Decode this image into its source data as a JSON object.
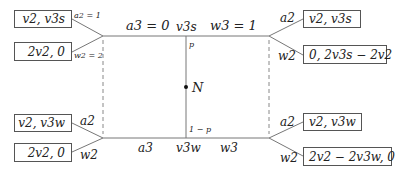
{
  "diagram": {
    "type": "game-tree",
    "nature_node": "N",
    "probabilities": {
      "top": "p",
      "bottom": "1 − p"
    },
    "top_branch": {
      "node_label": "v3s",
      "left_action": "a3 = 0",
      "right_action": "w3 = 1",
      "left_subtree": {
        "action_a_label": "a2 = 1",
        "action_w_label": "w2 = 2",
        "payoff_a": "v2, v3s",
        "payoff_w": "2v2, 0"
      },
      "right_subtree": {
        "action_a_label": "a2",
        "action_w_label": "w2",
        "payoff_a": "v2, v3s",
        "payoff_w": "0, 2v3s − 2v2"
      }
    },
    "bottom_branch": {
      "node_label": "v3w",
      "left_action": "a3",
      "right_action": "w3",
      "left_subtree": {
        "action_a_label": "a2",
        "action_w_label": "w2",
        "payoff_a": "v2, v3w",
        "payoff_w": "2v2, 0"
      },
      "right_subtree": {
        "action_a_label": "a2",
        "action_w_label": "w2",
        "payoff_a": "v2, v3w",
        "payoff_w": "2v2 − 2v3w, 0"
      }
    }
  }
}
